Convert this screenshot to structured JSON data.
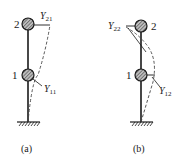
{
  "figures": [
    {
      "id": "a",
      "caption": "(a)",
      "nodes": [
        {
          "label": "2"
        },
        {
          "label": "1"
        }
      ],
      "mode_labels": [
        {
          "symbol": "Y",
          "subscript": "21"
        },
        {
          "symbol": "Y",
          "subscript": "11"
        }
      ]
    },
    {
      "id": "b",
      "caption": "(b)",
      "nodes": [
        {
          "label": "2"
        },
        {
          "label": "1"
        }
      ],
      "mode_labels": [
        {
          "symbol": "Y",
          "subscript": "22"
        },
        {
          "symbol": "Y",
          "subscript": "12"
        }
      ]
    }
  ],
  "colors": {
    "line": "#1a1a1a",
    "dashed": "#444444",
    "mass_fill": "#888888"
  }
}
